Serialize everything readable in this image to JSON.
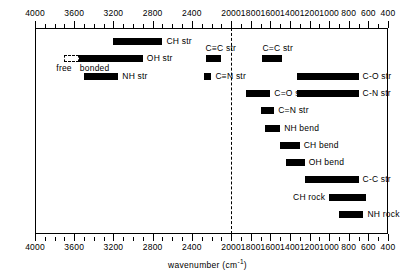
{
  "chart_data": {
    "type": "bar",
    "orientation": "horizontal-ranges",
    "title": "",
    "xlabel": "wavenumber (cm-1)",
    "xlabel_text": "wavenumber",
    "xlabel_unit_base": "(cm",
    "xlabel_unit_sup": "-1",
    "xlabel_unit_close": ")",
    "ylabel": "",
    "xlim": [
      4000,
      400
    ],
    "x_reversed": true,
    "axis_top": true,
    "axis_bottom": true,
    "grid": false,
    "legend": "none",
    "tick_labels": [
      "4000",
      "3600",
      "3200",
      "2800",
      "2400",
      "2000",
      "1800",
      "1600",
      "1400",
      "1200",
      "1000",
      "800",
      "600",
      "400"
    ],
    "tick_values": [
      4000,
      3600,
      3200,
      2800,
      2400,
      2000,
      1800,
      1600,
      1400,
      1200,
      1000,
      800,
      600,
      400
    ],
    "minor_tick_step": 100,
    "annotations": [
      {
        "name": "divider",
        "type": "vline",
        "value": 2000,
        "style": "dashed"
      }
    ],
    "bands": [
      {
        "name": "ch-str",
        "label": "CH str",
        "from": 3200,
        "to": 2700,
        "label_pos": "right",
        "fill": "solid"
      },
      {
        "name": "oh-str",
        "label": "OH str",
        "from": 3700,
        "to": 2900,
        "label_pos": "right",
        "fill": "split",
        "segments": [
          {
            "name": "free",
            "from": 3700,
            "to": 3550,
            "fill": "hollow"
          },
          {
            "name": "bonded",
            "from": 3550,
            "to": 2900,
            "fill": "solid"
          }
        ],
        "sub_labels": [
          {
            "name": "free-label",
            "text": "free",
            "value": 3660
          },
          {
            "name": "bonded-label",
            "text": "bonded",
            "value": 3420
          }
        ]
      },
      {
        "name": "nh-str",
        "label": "NH str",
        "from": 3500,
        "to": 3150,
        "label_pos": "right",
        "fill": "solid"
      },
      {
        "name": "cc-triple-str",
        "label": "C≡C str",
        "from": 2260,
        "to": 2100,
        "label_pos": "above",
        "fill": "solid"
      },
      {
        "name": "cc-double-str",
        "label": "C=C str",
        "from": 1680,
        "to": 1480,
        "label_pos": "above",
        "fill": "solid"
      },
      {
        "name": "cn-triple-str",
        "label": "C≡N str",
        "from": 2280,
        "to": 2200,
        "label_pos": "right",
        "fill": "solid"
      },
      {
        "name": "co-double-str",
        "label": "C=O str",
        "from": 1850,
        "to": 1600,
        "label_pos": "right",
        "fill": "solid"
      },
      {
        "name": "cn-double-str",
        "label": "C=N str",
        "from": 1700,
        "to": 1560,
        "label_pos": "right",
        "fill": "solid"
      },
      {
        "name": "nh-bend",
        "label": "NH bend",
        "from": 1650,
        "to": 1500,
        "label_pos": "right",
        "fill": "solid"
      },
      {
        "name": "ch-bend",
        "label": "CH bend",
        "from": 1500,
        "to": 1300,
        "label_pos": "right",
        "fill": "solid"
      },
      {
        "name": "oh-bend",
        "label": "OH bend",
        "from": 1440,
        "to": 1250,
        "label_pos": "right",
        "fill": "solid"
      },
      {
        "name": "c-o-str",
        "label": "C-O str",
        "from": 1330,
        "to": 700,
        "label_pos": "right",
        "fill": "solid"
      },
      {
        "name": "c-n-str",
        "label": "C-N str",
        "from": 1330,
        "to": 700,
        "label_pos": "right",
        "fill": "solid"
      },
      {
        "name": "c-c-str",
        "label": "C-C str",
        "from": 1250,
        "to": 700,
        "label_pos": "right",
        "fill": "solid"
      },
      {
        "name": "ch-rock",
        "label": "CH rock",
        "from": 1000,
        "to": 620,
        "label_pos": "left",
        "fill": "solid"
      },
      {
        "name": "nh-rock",
        "label": "NH rock",
        "from": 900,
        "to": 650,
        "label_pos": "right",
        "fill": "solid"
      }
    ],
    "band_rows": [
      {
        "name": "ch-str",
        "row": 0
      },
      {
        "name": "oh-str",
        "row": 1
      },
      {
        "name": "nh-str",
        "row": 2
      },
      {
        "name": "cc-triple-str",
        "row": 1
      },
      {
        "name": "cc-double-str",
        "row": 1
      },
      {
        "name": "cn-triple-str",
        "row": 2
      },
      {
        "name": "co-double-str",
        "row": 3
      },
      {
        "name": "cn-double-str",
        "row": 4
      },
      {
        "name": "nh-bend",
        "row": 5
      },
      {
        "name": "ch-bend",
        "row": 6
      },
      {
        "name": "oh-bend",
        "row": 7
      },
      {
        "name": "c-o-str",
        "row": 2
      },
      {
        "name": "c-n-str",
        "row": 3
      },
      {
        "name": "c-c-str",
        "row": 8
      },
      {
        "name": "ch-rock",
        "row": 9
      },
      {
        "name": "nh-rock",
        "row": 10
      }
    ]
  }
}
